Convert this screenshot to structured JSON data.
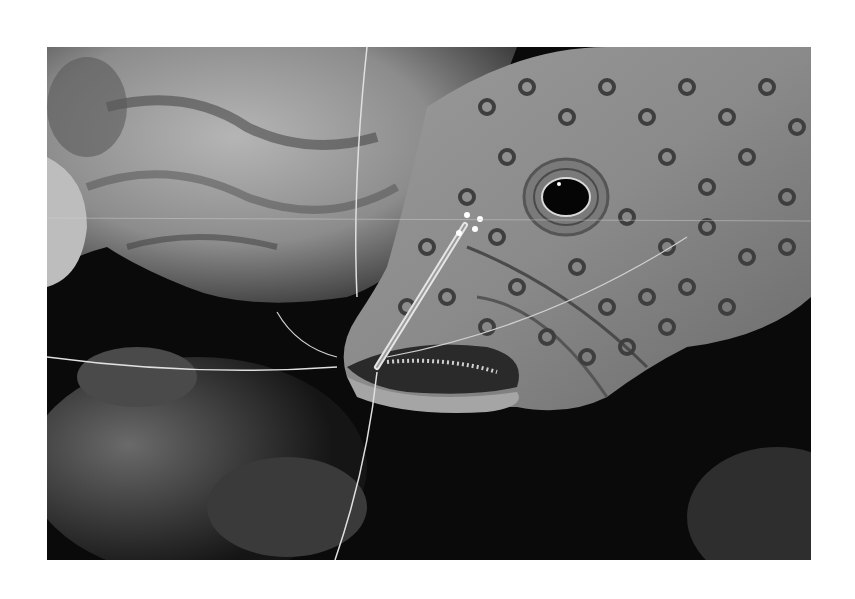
{
  "image": {
    "subject": "Spotted grouper with cleaner shrimp on its mouth",
    "alt": "Grayscale underwater photo of a spotted grouper fish with a cleaner shrimp perched at its mouth, coral rock in the background",
    "colors": {
      "background": "#ffffff",
      "photo_dark": "#0a0a0a",
      "fish_body": "#8a8a8a",
      "spots": "#3e3e3e",
      "coral": "#9a9a9a"
    }
  }
}
